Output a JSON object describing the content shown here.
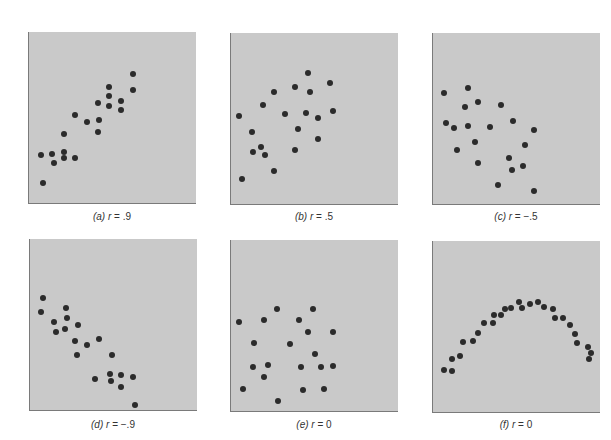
{
  "figure": {
    "panels": [
      {
        "id": "a",
        "letter": "(a)",
        "var": "r",
        "eq": " = ",
        "value": ".9"
      },
      {
        "id": "b",
        "letter": "(b)",
        "var": "r",
        "eq": " = ",
        "value": ".5"
      },
      {
        "id": "c",
        "letter": "(c)",
        "var": "r",
        "eq": " = ",
        "value": "−.5"
      },
      {
        "id": "d",
        "letter": "(d)",
        "var": "r",
        "eq": " = ",
        "value": "−.9"
      },
      {
        "id": "e",
        "letter": "(e)",
        "var": "r",
        "eq": " = ",
        "value": "0"
      },
      {
        "id": "f",
        "letter": "(f)",
        "var": "r",
        "eq": " = ",
        "value": "0"
      }
    ],
    "colors": {
      "panel_bg": "#c9c9c9",
      "dot": "#2b2b2b",
      "axis": "#7a7a7a"
    }
  },
  "chart_data": [
    {
      "type": "scatter",
      "title": "(a) r = .9",
      "xlabel": "",
      "ylabel": "",
      "grid": false,
      "note": "points in panel pixel coords (x right, y down), panel 168x172",
      "points": [
        [
          104,
          42
        ],
        [
          104,
          58
        ],
        [
          80,
          55
        ],
        [
          80,
          64
        ],
        [
          80,
          74
        ],
        [
          92,
          69
        ],
        [
          92,
          78
        ],
        [
          69,
          71
        ],
        [
          70,
          88
        ],
        [
          69,
          100
        ],
        [
          58,
          90
        ],
        [
          46,
          83
        ],
        [
          35,
          102
        ],
        [
          35,
          120
        ],
        [
          35,
          126
        ],
        [
          46,
          126
        ],
        [
          23,
          122
        ],
        [
          25,
          131
        ],
        [
          12,
          123
        ],
        [
          14,
          151
        ]
      ]
    },
    {
      "type": "scatter",
      "title": "(b) r = .5",
      "xlabel": "",
      "ylabel": "",
      "grid": false,
      "points": [
        [
          77,
          40
        ],
        [
          99,
          50
        ],
        [
          64,
          54
        ],
        [
          79,
          59
        ],
        [
          43,
          59
        ],
        [
          32,
          72
        ],
        [
          8,
          83
        ],
        [
          54,
          81
        ],
        [
          75,
          80
        ],
        [
          102,
          78
        ],
        [
          87,
          85
        ],
        [
          67,
          96
        ],
        [
          21,
          99
        ],
        [
          87,
          106
        ],
        [
          30,
          114
        ],
        [
          22,
          119
        ],
        [
          34,
          122
        ],
        [
          64,
          117
        ],
        [
          43,
          138
        ],
        [
          11,
          146
        ]
      ]
    },
    {
      "type": "scatter",
      "title": "(c) r = −.5",
      "xlabel": "",
      "ylabel": "",
      "grid": false,
      "points": [
        [
          11,
          60
        ],
        [
          35,
          55
        ],
        [
          45,
          69
        ],
        [
          32,
          74
        ],
        [
          68,
          72
        ],
        [
          13,
          90
        ],
        [
          21,
          95
        ],
        [
          35,
          93
        ],
        [
          57,
          94
        ],
        [
          80,
          88
        ],
        [
          101,
          97
        ],
        [
          42,
          109
        ],
        [
          92,
          112
        ],
        [
          24,
          117
        ],
        [
          76,
          125
        ],
        [
          45,
          130
        ],
        [
          90,
          133
        ],
        [
          79,
          137
        ],
        [
          65,
          152
        ],
        [
          101,
          158
        ]
      ]
    },
    {
      "type": "scatter",
      "title": "(d) r = −.9",
      "xlabel": "",
      "ylabel": "",
      "grid": false,
      "points": [
        [
          13,
          59
        ],
        [
          11,
          73
        ],
        [
          36,
          69
        ],
        [
          37,
          79
        ],
        [
          24,
          83
        ],
        [
          26,
          93
        ],
        [
          35,
          90
        ],
        [
          48,
          86
        ],
        [
          45,
          102
        ],
        [
          57,
          106
        ],
        [
          69,
          100
        ],
        [
          47,
          116
        ],
        [
          82,
          116
        ],
        [
          65,
          140
        ],
        [
          80,
          135
        ],
        [
          81,
          142
        ],
        [
          91,
          136
        ],
        [
          91,
          148
        ],
        [
          103,
          138
        ],
        [
          105,
          166
        ]
      ]
    },
    {
      "type": "scatter",
      "title": "(e) r = 0",
      "xlabel": "",
      "ylabel": "",
      "grid": false,
      "points": [
        [
          46,
          69
        ],
        [
          82,
          69
        ],
        [
          8,
          82
        ],
        [
          33,
          80
        ],
        [
          68,
          80
        ],
        [
          77,
          92
        ],
        [
          102,
          92
        ],
        [
          23,
          103
        ],
        [
          59,
          104
        ],
        [
          84,
          114
        ],
        [
          22,
          127
        ],
        [
          37,
          125
        ],
        [
          70,
          127
        ],
        [
          90,
          127
        ],
        [
          102,
          126
        ],
        [
          33,
          137
        ],
        [
          12,
          149
        ],
        [
          72,
          150
        ],
        [
          93,
          149
        ],
        [
          47,
          161
        ]
      ]
    },
    {
      "type": "scatter",
      "title": "(f) r = 0",
      "xlabel": "",
      "ylabel": "",
      "grid": false,
      "points": [
        [
          11,
          129
        ],
        [
          19,
          130
        ],
        [
          19,
          118
        ],
        [
          27,
          115
        ],
        [
          30,
          101
        ],
        [
          40,
          100
        ],
        [
          45,
          92
        ],
        [
          51,
          82
        ],
        [
          60,
          82
        ],
        [
          61,
          74
        ],
        [
          68,
          74
        ],
        [
          72,
          68
        ],
        [
          78,
          67
        ],
        [
          86,
          61
        ],
        [
          89,
          67
        ],
        [
          97,
          63
        ],
        [
          105,
          61
        ],
        [
          111,
          66
        ],
        [
          120,
          68
        ],
        [
          122,
          77
        ],
        [
          130,
          77
        ],
        [
          137,
          84
        ],
        [
          142,
          93
        ],
        [
          144,
          102
        ],
        [
          155,
          106
        ],
        [
          158,
          112
        ],
        [
          156,
          118
        ]
      ]
    }
  ]
}
